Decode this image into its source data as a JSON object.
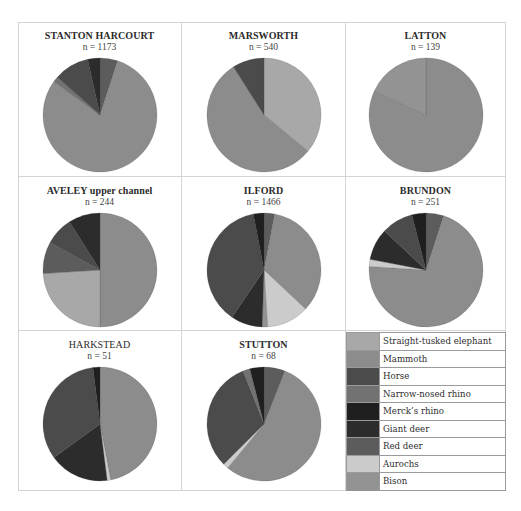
{
  "chart_data": [
    {
      "type": "pie",
      "title": "STANTON HARCOURT",
      "n_label": "n = 1173",
      "n": 1173,
      "slices": [
        {
          "label": "Red deer",
          "value": 5
        },
        {
          "label": "Mammoth",
          "value": 80
        },
        {
          "label": "Narrow-nosed rhino",
          "value": 1.5
        },
        {
          "label": "Horse",
          "value": 10
        },
        {
          "label": "Giant deer",
          "value": 3.5
        }
      ]
    },
    {
      "type": "pie",
      "title": "MARSWORTH",
      "n_label": "n = 540",
      "n": 540,
      "slices": [
        {
          "label": "Straight-tusked elephant",
          "value": 36
        },
        {
          "label": "Mammoth",
          "value": 55
        },
        {
          "label": "Horse",
          "value": 9
        }
      ]
    },
    {
      "type": "pie",
      "title": "LATTON",
      "n_label": "n = 139",
      "n": 139,
      "slices": [
        {
          "label": "Mammoth",
          "value": 82
        },
        {
          "label": "Bison",
          "value": 18
        }
      ]
    },
    {
      "type": "pie",
      "title": "AVELEY upper channel",
      "n_label": "n = 244",
      "n": 244,
      "slices": [
        {
          "label": "Mammoth",
          "value": 50
        },
        {
          "label": "Straight-tusked elephant",
          "value": 24
        },
        {
          "label": "Red deer",
          "value": 9
        },
        {
          "label": "Horse",
          "value": 8
        },
        {
          "label": "Giant deer",
          "value": 9
        }
      ]
    },
    {
      "type": "pie",
      "title": "ILFORD",
      "n_label": "n = 1466",
      "n": 1466,
      "slices": [
        {
          "label": "Red deer",
          "value": 3
        },
        {
          "label": "Mammoth",
          "value": 34
        },
        {
          "label": "Aurochs",
          "value": 12
        },
        {
          "label": "Bison",
          "value": 1.5
        },
        {
          "label": "Giant deer",
          "value": 9
        },
        {
          "label": "Horse",
          "value": 37.5
        },
        {
          "label": "Merck's rhino",
          "value": 3
        }
      ]
    },
    {
      "type": "pie",
      "title": "BRUNDON",
      "n_label": "n = 251",
      "n": 251,
      "slices": [
        {
          "label": "Red deer",
          "value": 5
        },
        {
          "label": "Mammoth",
          "value": 71
        },
        {
          "label": "Aurochs",
          "value": 2
        },
        {
          "label": "Giant deer",
          "value": 9
        },
        {
          "label": "Horse",
          "value": 9
        },
        {
          "label": "Merck's rhino",
          "value": 4
        }
      ]
    },
    {
      "type": "pie",
      "title": "HARKSTEAD",
      "n_label": "n = 51",
      "n": 51,
      "slices": [
        {
          "label": "Mammoth",
          "value": 47
        },
        {
          "label": "Aurochs",
          "value": 1
        },
        {
          "label": "Giant deer",
          "value": 17
        },
        {
          "label": "Horse",
          "value": 33
        },
        {
          "label": "Merck's rhino",
          "value": 2
        }
      ]
    },
    {
      "type": "pie",
      "title": "STUTTON",
      "n_label": "n = 68",
      "n": 68,
      "slices": [
        {
          "label": "Red deer",
          "value": 6
        },
        {
          "label": "Mammoth",
          "value": 55
        },
        {
          "label": "Aurochs",
          "value": 1.5
        },
        {
          "label": "Horse",
          "value": 31.5
        },
        {
          "label": "Narrow-nosed rhino",
          "value": 2
        },
        {
          "label": "Merck's rhino",
          "value": 4
        }
      ]
    }
  ],
  "legend": [
    {
      "label": "Straight-tusked elephant",
      "color": "#a8a8a8"
    },
    {
      "label": "Mammoth",
      "color": "#8c8c8c"
    },
    {
      "label": "Horse",
      "color": "#4b4b4b"
    },
    {
      "label": "Narrow-nosed rhino",
      "color": "#727272"
    },
    {
      "label": "Merck’s rhino",
      "color": "#1f1f1f"
    },
    {
      "label": "Giant deer",
      "color": "#2c2c2c"
    },
    {
      "label": "Red deer",
      "color": "#5c5c5c"
    },
    {
      "label": "Aurochs",
      "color": "#cbcbcb"
    },
    {
      "label": "Bison",
      "color": "#939393"
    }
  ]
}
